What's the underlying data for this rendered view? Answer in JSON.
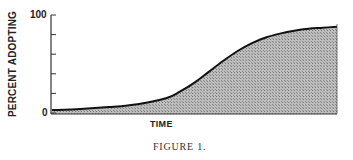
{
  "chart_data": {
    "type": "area",
    "title": "",
    "caption": "FIGURE 1.",
    "xlabel": "TIME",
    "ylabel": "PERCENT ADOPTING",
    "ylim": [
      0,
      100
    ],
    "yticks": [
      0,
      20,
      40,
      60,
      80,
      100
    ],
    "ytick_labels": [
      "0",
      "100"
    ],
    "grid": false,
    "legend": null,
    "x": [
      0,
      10,
      20,
      30,
      40,
      45,
      50,
      55,
      60,
      65,
      70,
      75,
      80,
      85,
      90,
      95,
      100
    ],
    "series": [
      {
        "name": "Cumulative adoption (S-curve)",
        "values": [
          3,
          4,
          6,
          9,
          15,
          22,
          31,
          42,
          53,
          63,
          71,
          77,
          81,
          84,
          86,
          87,
          88
        ]
      }
    ],
    "fill": "stippled gray under curve"
  },
  "colors": {
    "line": "#111111",
    "fill": "#a8a8a8",
    "axis": "#333333"
  }
}
